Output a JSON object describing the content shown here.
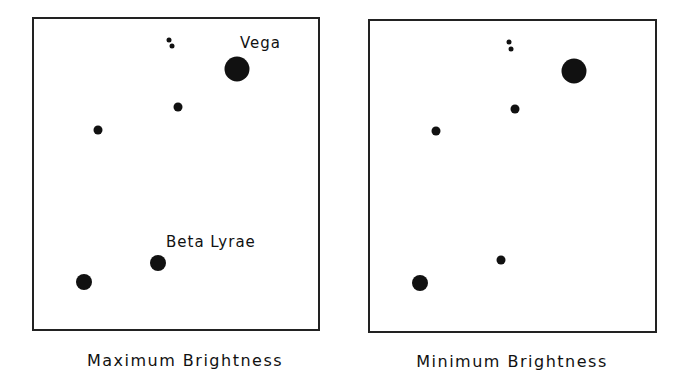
{
  "panels": [
    {
      "caption": "Maximum Brightness",
      "labels": {
        "vega": "Vega",
        "beta_lyrae": "Beta Lyrae"
      }
    },
    {
      "caption": "Minimum Brightness"
    }
  ],
  "star_color": "#111111",
  "frame_color": "#222222"
}
